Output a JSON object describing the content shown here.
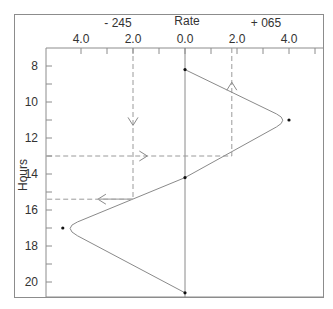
{
  "chart_data": {
    "type": "line",
    "title": "Rate",
    "xlabel": "Rate",
    "ylabel": "Hours",
    "x_group_labels": {
      "left": "- 245",
      "center": "Rate",
      "right": "+ 065"
    },
    "x_tick_labels": [
      {
        "value": -4.0,
        "label": "4.0"
      },
      {
        "value": -2.0,
        "label": "2.0"
      },
      {
        "value": 0.0,
        "label": "0.0"
      },
      {
        "value": 2.0,
        "label": "2.0"
      },
      {
        "value": 4.0,
        "label": "4.0"
      }
    ],
    "x_minor_ticks": [
      -4,
      -3,
      -2,
      -1,
      0,
      1,
      2,
      3,
      4,
      5
    ],
    "xlim": [
      -5.3,
      5.3
    ],
    "y_tick_labels": [
      8,
      10,
      12,
      14,
      16,
      18,
      20
    ],
    "y_minor_ticks": [
      8,
      9,
      10,
      11,
      12,
      13,
      14,
      15,
      16,
      17,
      18,
      19,
      20
    ],
    "ylim": [
      7.0,
      20.9
    ],
    "y_inverted": true,
    "grid": false,
    "series": [
      {
        "name": "rate-curve",
        "points": [
          {
            "x": 0.0,
            "y": 8.2
          },
          {
            "x": 4.0,
            "y": 11.0
          },
          {
            "x": 0.0,
            "y": 14.2
          },
          {
            "x": -4.7,
            "y": 17.0
          },
          {
            "x": 0.0,
            "y": 20.6
          }
        ]
      }
    ],
    "reference_lines": [
      {
        "type": "vertical",
        "x": 0.0,
        "style": "solid"
      },
      {
        "type": "vertical",
        "x": -2.0,
        "from_y": 7.0,
        "to_y": 15.4,
        "style": "dashed"
      },
      {
        "type": "vertical",
        "x": 1.8,
        "from_y": 7.0,
        "to_y": 13.0,
        "style": "dashed"
      },
      {
        "type": "horizontal",
        "y": 13.0,
        "from_x": -5.3,
        "to_x": 1.8,
        "style": "dashed"
      },
      {
        "type": "horizontal",
        "y": 15.4,
        "from_x": -5.3,
        "to_x": -2.0,
        "style": "dashed"
      }
    ],
    "annotations": [
      {
        "type": "arrow",
        "direction": "down",
        "x": -2.0,
        "y": 11.3
      },
      {
        "type": "arrow",
        "direction": "up",
        "x": 1.8,
        "y": 8.9
      },
      {
        "type": "arrow",
        "direction": "right",
        "x": -1.45,
        "y": 13.0
      },
      {
        "type": "arrow",
        "direction": "left",
        "x": -3.35,
        "y": 15.4
      }
    ]
  },
  "colors": {
    "frame": "#8c8c8c",
    "curve": "#8a8a8a",
    "dashed": "#9a9a9a",
    "text": "#333333",
    "point": "#111111"
  }
}
